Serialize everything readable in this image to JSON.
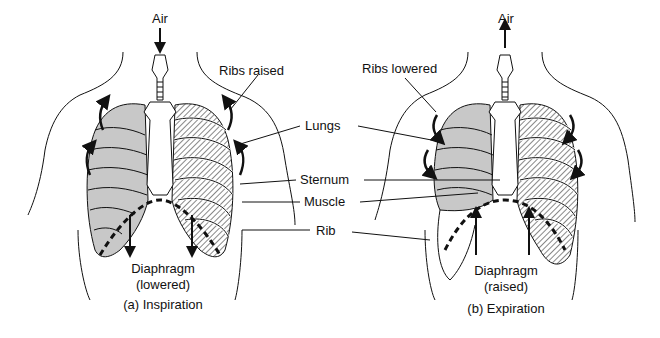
{
  "panels": [
    {
      "id": "a",
      "caption": "(a) Inspiration",
      "air_label": "Air",
      "air_direction": "in",
      "ribs_label": "Ribs raised",
      "diaphragm_label": "Diaphragm",
      "diaphragm_state": "(lowered)"
    },
    {
      "id": "b",
      "caption": "(b) Expiration",
      "air_label": "Air",
      "air_direction": "out",
      "ribs_label": "Ribs lowered",
      "diaphragm_label": "Diaphragm",
      "diaphragm_state": "(raised)"
    }
  ],
  "shared_labels": {
    "lungs": "Lungs",
    "sternum": "Sternum",
    "muscle": "Muscle",
    "rib": "Rib"
  },
  "colors": {
    "line": "#111111",
    "lung_fill": "#c8c8c8",
    "background": "#ffffff"
  }
}
